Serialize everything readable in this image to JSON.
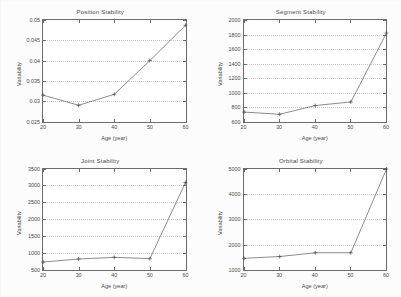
{
  "figure": {
    "background_color": "#fcfcfc",
    "axis_color": "#6d6d6d",
    "line_color": "#5a5a5a",
    "grid_color": "#c9c9c9"
  },
  "chart_data": [
    {
      "type": "line",
      "title": "Position Stability",
      "xlabel": "Age (year)",
      "ylabel": "Variability",
      "x": [
        20,
        30,
        40,
        50,
        60
      ],
      "values": [
        0.0315,
        0.029,
        0.0317,
        0.04,
        0.0487
      ],
      "xlim": [
        20,
        60
      ],
      "ylim": [
        0.025,
        0.05
      ],
      "xticks": [
        20,
        30,
        40,
        50,
        60
      ],
      "xticklabels": [
        "20",
        "30",
        "40",
        "50",
        "60"
      ],
      "yticks": [
        0.025,
        0.03,
        0.035,
        0.04,
        0.045,
        0.05
      ],
      "yticklabels": [
        "0.025",
        "0.03",
        "0.035",
        "0.04",
        "0.045",
        "0.05"
      ],
      "grid": true,
      "legend": "none",
      "marker": "plus"
    },
    {
      "type": "line",
      "title": "Segment Stability",
      "xlabel": "Age (year)",
      "ylabel": "Variability",
      "x": [
        20,
        30,
        40,
        50,
        60
      ],
      "values": [
        730,
        700,
        820,
        870,
        1820
      ],
      "xlim": [
        20,
        60
      ],
      "ylim": [
        600,
        2000
      ],
      "xticks": [
        20,
        30,
        40,
        50,
        60
      ],
      "xticklabels": [
        "20",
        "30",
        "40",
        "50",
        "60"
      ],
      "yticks": [
        600,
        800,
        1000,
        1200,
        1400,
        1600,
        1800,
        2000
      ],
      "yticklabels": [
        "600",
        "800",
        "1000",
        "1200",
        "1400",
        "1600",
        "1800",
        "2000"
      ],
      "grid": true,
      "legend": "none",
      "marker": "plus"
    },
    {
      "type": "line",
      "title": "Joint Stability",
      "xlabel": "Age (year)",
      "ylabel": "Variability",
      "x": [
        20,
        30,
        40,
        50,
        60
      ],
      "values": [
        750,
        840,
        890,
        850,
        3100
      ],
      "xlim": [
        20,
        60
      ],
      "ylim": [
        500,
        3500
      ],
      "xticks": [
        20,
        30,
        40,
        50,
        60
      ],
      "xticklabels": [
        "20",
        "30",
        "40",
        "50",
        "60"
      ],
      "yticks": [
        500,
        1000,
        1500,
        2000,
        2500,
        3000,
        3500
      ],
      "yticklabels": [
        "500",
        "1000",
        "1500",
        "2000",
        "2500",
        "3000",
        "3500"
      ],
      "grid": true,
      "legend": "none",
      "marker": "plus"
    },
    {
      "type": "line",
      "title": "Orbital Stability",
      "xlabel": "Age (year)",
      "ylabel": "Variability",
      "x": [
        20,
        30,
        40,
        50,
        60
      ],
      "values": [
        1480,
        1550,
        1700,
        1700,
        5000
      ],
      "xlim": [
        20,
        60
      ],
      "ylim": [
        1000,
        5000
      ],
      "xticks": [
        20,
        30,
        40,
        50,
        60
      ],
      "xticklabels": [
        "20",
        "30",
        "40",
        "50",
        "60"
      ],
      "yticks": [
        1000,
        2000,
        3000,
        4000,
        5000
      ],
      "yticklabels": [
        "1000",
        "2000",
        "3000",
        "4000",
        "5000"
      ],
      "grid": true,
      "legend": "none",
      "marker": "plus"
    }
  ]
}
